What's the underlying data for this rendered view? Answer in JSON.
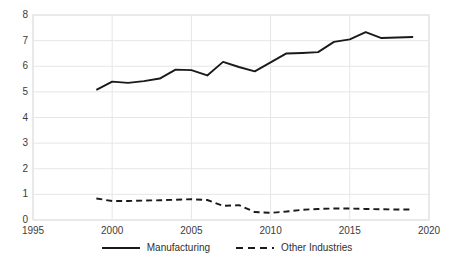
{
  "chart_data": {
    "type": "line",
    "title": "",
    "subtitle": "",
    "xlabel": "",
    "ylabel": "",
    "xlim": [
      1995,
      2020
    ],
    "ylim": [
      0,
      8
    ],
    "x_ticks": [
      1995,
      2000,
      2005,
      2010,
      2015,
      2020
    ],
    "y_ticks": [
      0,
      1,
      2,
      3,
      4,
      5,
      6,
      7,
      8
    ],
    "grid": "horizontal-and-vertical",
    "legend_position": "bottom-center",
    "x": [
      1999,
      2000,
      2001,
      2002,
      2003,
      2004,
      2005,
      2006,
      2007,
      2008,
      2009,
      2010,
      2011,
      2012,
      2013,
      2014,
      2015,
      2016,
      2017,
      2018,
      2019
    ],
    "series": [
      {
        "name": "Manufacturing",
        "style": "solid",
        "color": "#1a1a1a",
        "values": [
          5.08,
          5.4,
          5.35,
          5.42,
          5.52,
          5.87,
          5.85,
          5.64,
          6.17,
          5.97,
          5.8,
          6.15,
          6.5,
          6.52,
          6.55,
          6.95,
          7.05,
          7.33,
          7.1,
          7.12,
          7.14
        ]
      },
      {
        "name": "Other Industries",
        "style": "dashed",
        "color": "#1a1a1a",
        "values": [
          0.84,
          0.74,
          0.74,
          0.76,
          0.77,
          0.79,
          0.81,
          0.78,
          0.55,
          0.58,
          0.31,
          0.28,
          0.33,
          0.4,
          0.43,
          0.45,
          0.45,
          0.43,
          0.42,
          0.41,
          0.41
        ]
      }
    ]
  },
  "legend": {
    "items": [
      {
        "label": "Manufacturing",
        "style": "solid"
      },
      {
        "label": "Other Industries",
        "style": "dashed"
      }
    ]
  },
  "axis": {
    "y_labels": [
      "8",
      "7",
      "6",
      "5",
      "4",
      "3",
      "2",
      "1",
      "0"
    ],
    "x_labels": [
      "1995",
      "2000",
      "2005",
      "2010",
      "2015",
      "2020"
    ]
  }
}
